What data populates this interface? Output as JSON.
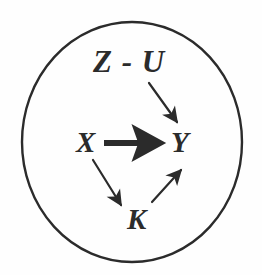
{
  "figure": {
    "name": "causal-diagram-ellipse",
    "background_color": "#fefefe",
    "ink_color": "#2b2b2b",
    "boundary": {
      "shape": "ellipse",
      "cx": 132,
      "cy": 142,
      "rx": 110,
      "ry": 120,
      "stroke_width": 2.4
    },
    "nodes": [
      {
        "id": "zu",
        "label": "Z - U",
        "x": 93,
        "y": 46
      },
      {
        "id": "x",
        "label": "X",
        "x": 76,
        "y": 128
      },
      {
        "id": "y",
        "label": "Y",
        "x": 171,
        "y": 128
      },
      {
        "id": "k",
        "label": "K",
        "x": 127,
        "y": 205
      }
    ],
    "edges": [
      {
        "id": "zu-to-y",
        "from": "zu",
        "to": "y",
        "style": "thin",
        "direction": "down-right"
      },
      {
        "id": "x-to-y",
        "from": "x",
        "to": "y",
        "style": "bold",
        "direction": "right"
      },
      {
        "id": "x-to-k",
        "from": "x",
        "to": "k",
        "style": "thin",
        "direction": "down-right"
      },
      {
        "id": "k-to-y",
        "from": "k",
        "to": "y",
        "style": "thin",
        "direction": "up-right"
      }
    ]
  }
}
